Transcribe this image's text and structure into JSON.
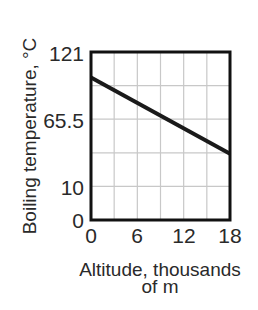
{
  "chart_data": {
    "type": "line",
    "title": "",
    "xlabel": "Altitude, thousands of m",
    "xlabel_lines": [
      "Altitude, thousands",
      "of m"
    ],
    "ylabel": "Boiling temperature, °C",
    "x_ticks": [
      0,
      6,
      12,
      18
    ],
    "x_tick_labels": [
      "0",
      "6",
      "12",
      "18"
    ],
    "y_tick_labels": [
      "121",
      "65.5",
      "10",
      "0"
    ],
    "y_tick_values": [
      121,
      65.5,
      10,
      0
    ],
    "xlim": [
      0,
      18
    ],
    "ylim": [
      0,
      121
    ],
    "grid": true,
    "grid_x_divisions": 6,
    "grid_y_divisions": 5,
    "series": [
      {
        "name": "Boiling temperature",
        "x": [
          0,
          18
        ],
        "y": [
          100,
          37
        ]
      }
    ],
    "colors": {
      "line": "#1a1a1a",
      "frame": "#111111",
      "grid": "#c8c8c8",
      "text": "#2a2a2a"
    }
  }
}
